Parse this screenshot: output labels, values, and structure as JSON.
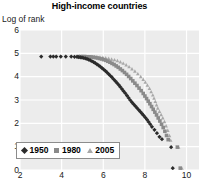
{
  "chart_data": {
    "type": "scatter",
    "title": "High-income countries",
    "xlabel": "",
    "ylabel": "Log of rank",
    "xlim": [
      2,
      10.6
    ],
    "ylim": [
      0,
      6
    ],
    "xticks": [
      2,
      4,
      6,
      8,
      10
    ],
    "yticks": [
      0,
      1,
      2,
      3,
      4,
      5,
      6
    ],
    "xtick_labels": [
      "2",
      "4",
      "6",
      "8",
      "10"
    ],
    "ytick_labels": [
      "0",
      "1",
      "2",
      "3",
      "4",
      "5",
      "6"
    ],
    "grid": true,
    "grid_color": "#ffffff",
    "plot_bg": "#ececec",
    "legend_position": "lower-left",
    "series": [
      {
        "name": "1950",
        "marker": "diamond",
        "color": "#2b2b2b",
        "points": [
          [
            3.02,
            4.86
          ],
          [
            3.46,
            4.86
          ],
          [
            3.6,
            4.86
          ],
          [
            3.74,
            4.86
          ],
          [
            3.96,
            4.86
          ],
          [
            4.2,
            4.86
          ],
          [
            4.46,
            4.86
          ],
          [
            4.62,
            4.85
          ],
          [
            4.74,
            4.85
          ],
          [
            4.82,
            4.84
          ],
          [
            4.9,
            4.83
          ],
          [
            4.98,
            4.82
          ],
          [
            5.06,
            4.8
          ],
          [
            5.14,
            4.78
          ],
          [
            5.22,
            4.76
          ],
          [
            5.3,
            4.73
          ],
          [
            5.38,
            4.7
          ],
          [
            5.46,
            4.66
          ],
          [
            5.54,
            4.62
          ],
          [
            5.62,
            4.58
          ],
          [
            5.7,
            4.53
          ],
          [
            5.78,
            4.48
          ],
          [
            5.86,
            4.43
          ],
          [
            5.94,
            4.37
          ],
          [
            6.02,
            4.31
          ],
          [
            6.1,
            4.25
          ],
          [
            6.18,
            4.18
          ],
          [
            6.26,
            4.11
          ],
          [
            6.34,
            4.04
          ],
          [
            6.42,
            3.97
          ],
          [
            6.5,
            3.89
          ],
          [
            6.58,
            3.81
          ],
          [
            6.66,
            3.73
          ],
          [
            6.74,
            3.65
          ],
          [
            6.82,
            3.56
          ],
          [
            6.9,
            3.47
          ],
          [
            6.98,
            3.38
          ],
          [
            7.06,
            3.29
          ],
          [
            7.14,
            3.19
          ],
          [
            7.22,
            3.09
          ],
          [
            7.3,
            2.99
          ],
          [
            7.38,
            2.9
          ],
          [
            7.46,
            2.82
          ],
          [
            7.54,
            2.74
          ],
          [
            7.62,
            2.66
          ],
          [
            7.7,
            2.58
          ],
          [
            7.78,
            2.5
          ],
          [
            7.86,
            2.42
          ],
          [
            7.94,
            2.34
          ],
          [
            8.02,
            2.25
          ],
          [
            8.1,
            2.16
          ],
          [
            8.18,
            2.06
          ],
          [
            8.26,
            1.96
          ],
          [
            8.34,
            1.85
          ],
          [
            8.46,
            1.72
          ],
          [
            8.58,
            1.58
          ],
          [
            8.7,
            1.42
          ],
          [
            8.82,
            1.32
          ],
          [
            9.26,
            0.98
          ],
          [
            9.34,
            0.08
          ]
        ]
      },
      {
        "name": "1980",
        "marker": "square",
        "color": "#8a8a8a",
        "points": [
          [
            4.8,
            4.86
          ],
          [
            4.92,
            4.86
          ],
          [
            5.02,
            4.86
          ],
          [
            5.12,
            4.86
          ],
          [
            5.22,
            4.85
          ],
          [
            5.32,
            4.85
          ],
          [
            5.42,
            4.84
          ],
          [
            5.52,
            4.83
          ],
          [
            5.62,
            4.82
          ],
          [
            5.72,
            4.8
          ],
          [
            5.82,
            4.78
          ],
          [
            5.92,
            4.76
          ],
          [
            6.02,
            4.73
          ],
          [
            6.12,
            4.7
          ],
          [
            6.22,
            4.66
          ],
          [
            6.32,
            4.62
          ],
          [
            6.42,
            4.57
          ],
          [
            6.52,
            4.52
          ],
          [
            6.62,
            4.46
          ],
          [
            6.72,
            4.4
          ],
          [
            6.82,
            4.33
          ],
          [
            6.92,
            4.26
          ],
          [
            7.02,
            4.18
          ],
          [
            7.12,
            4.1
          ],
          [
            7.22,
            4.01
          ],
          [
            7.32,
            3.92
          ],
          [
            7.42,
            3.82
          ],
          [
            7.52,
            3.72
          ],
          [
            7.62,
            3.62
          ],
          [
            7.72,
            3.51
          ],
          [
            7.82,
            3.4
          ],
          [
            7.92,
            3.28
          ],
          [
            8.0,
            3.17
          ],
          [
            8.08,
            3.06
          ],
          [
            8.16,
            2.95
          ],
          [
            8.24,
            2.84
          ],
          [
            8.32,
            2.72
          ],
          [
            8.4,
            2.6
          ],
          [
            8.48,
            2.48
          ],
          [
            8.56,
            2.36
          ],
          [
            8.64,
            2.23
          ],
          [
            8.72,
            2.1
          ],
          [
            8.8,
            1.96
          ],
          [
            8.88,
            1.82
          ],
          [
            8.96,
            1.66
          ],
          [
            9.04,
            1.48
          ],
          [
            9.12,
            1.3
          ],
          [
            9.56,
            0.98
          ],
          [
            9.7,
            0.08
          ]
        ]
      },
      {
        "name": "2005",
        "marker": "triangle",
        "color": "#a8a8a8",
        "points": [
          [
            4.86,
            4.88
          ],
          [
            5.0,
            4.88
          ],
          [
            5.14,
            4.88
          ],
          [
            5.28,
            4.87
          ],
          [
            5.42,
            4.87
          ],
          [
            5.56,
            4.86
          ],
          [
            5.7,
            4.85
          ],
          [
            5.84,
            4.84
          ],
          [
            5.98,
            4.83
          ],
          [
            6.12,
            4.81
          ],
          [
            6.26,
            4.79
          ],
          [
            6.4,
            4.76
          ],
          [
            6.54,
            4.73
          ],
          [
            6.68,
            4.69
          ],
          [
            6.82,
            4.64
          ],
          [
            6.96,
            4.58
          ],
          [
            7.1,
            4.51
          ],
          [
            7.24,
            4.43
          ],
          [
            7.38,
            4.34
          ],
          [
            7.52,
            4.24
          ],
          [
            7.66,
            4.13
          ],
          [
            7.8,
            4.01
          ],
          [
            7.92,
            3.89
          ],
          [
            8.02,
            3.77
          ],
          [
            8.12,
            3.64
          ],
          [
            8.22,
            3.5
          ],
          [
            8.3,
            3.36
          ],
          [
            8.38,
            3.22
          ],
          [
            8.44,
            3.08
          ],
          [
            8.5,
            2.94
          ],
          [
            8.56,
            2.8
          ],
          [
            8.62,
            2.66
          ],
          [
            8.7,
            2.52
          ],
          [
            8.78,
            2.38
          ],
          [
            8.86,
            2.24
          ],
          [
            8.94,
            2.08
          ],
          [
            9.02,
            1.9
          ],
          [
            9.1,
            1.7
          ],
          [
            9.18,
            1.48
          ],
          [
            9.24,
            1.28
          ],
          [
            9.62,
            0.98
          ],
          [
            9.78,
            0.08
          ]
        ]
      }
    ],
    "legend": [
      {
        "label": "1950",
        "marker": "diamond",
        "color": "#2b2b2b"
      },
      {
        "label": "1980",
        "marker": "square",
        "color": "#8a8a8a"
      },
      {
        "label": "2005",
        "marker": "triangle",
        "color": "#a8a8a8"
      }
    ]
  }
}
